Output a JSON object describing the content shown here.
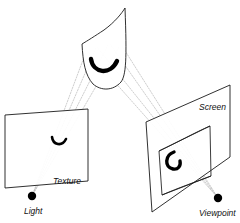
{
  "figure": {
    "background_color": "#ffffff",
    "line_color": "#1a1a1a",
    "ray_color": "#b9b9b9",
    "mark_color": "#000000"
  },
  "labels": {
    "texture": "Texture",
    "light": "Light",
    "screen": "Screen",
    "viewpoint": "Viewpoint"
  },
  "points": {
    "light": {
      "x": 32,
      "y": 196,
      "r": 4.2
    },
    "viewpoint": {
      "x": 218,
      "y": 198,
      "r": 4.2
    }
  },
  "label_positions": {
    "texture": {
      "x": 53,
      "y": 184
    },
    "light": {
      "x": 24,
      "y": 214
    },
    "screen": {
      "x": 199,
      "y": 110
    },
    "viewpoint": {
      "x": 199,
      "y": 216
    }
  },
  "shapes": {
    "curved_surface": {
      "name": "curved-surface",
      "outline": "M 82,44 C 83,62 85,75 93,84 C 101,91 113,91 121,82 C 126,75 127,60 125,8 C 122,13 115,22 104,30 C 95,36 87,41 82,44 Z",
      "fill": "#ffffff"
    },
    "texture_plane": {
      "name": "texture-plane",
      "points": "5,115 88,109 88,181 5,188",
      "fill": "#ffffff"
    },
    "screen_plane": {
      "name": "screen-plane",
      "points": "146,122 230,85 230,157 152,212",
      "fill": "#ffffff"
    },
    "screen_inner_quad": {
      "name": "screen-inner-quad",
      "points": "159,151 210,126 211,176 162,195",
      "fill": "none"
    },
    "screen_inner_curve_top": "M 159,151 C 176,143 196,132 210,126",
    "screen_inner_curve_bottom": "M 162,195 C 178,188 198,181 211,176",
    "surface_marks": {
      "curved_arc": "M 91,59 C 93,73 110,76 117,61",
      "texture_arc": "M 52,137 C 53,145 62,147 66,139",
      "screen_arc": "M 174,152 C 165,155 164,167 173,169 C 178,170 181,166 180,161"
    }
  },
  "rays": {
    "light_rays": [
      "M 32,196 L 86,52",
      "M 32,196 L 96,48",
      "M 32,196 L 108,45",
      "M 32,196 L 119,47"
    ],
    "view_rays": [
      "M 218,198 L 88,52",
      "M 218,198 L 97,47",
      "M 218,198 L 110,44",
      "M 218,198 L 122,46"
    ]
  },
  "description": {
    "line1": "A curved surface at top receives projected texture from a Light source through a Texture plane.",
    "line2": "The same curved surface is viewed from a Viewpoint through a Screen plane."
  }
}
